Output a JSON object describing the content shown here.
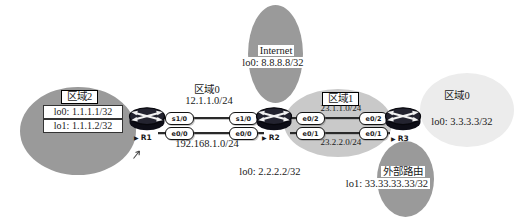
{
  "diagram_title": "OSPF multi-area network topology",
  "colors": {
    "cloud_gray": "#9a9a9a",
    "cloud_light_gray": "#c9c9c9",
    "cloud_pale_gray": "#ececec",
    "link_line": "#2a2a2a",
    "text": "#1a1a1a",
    "router_body": "#14141e",
    "box_bg": "#ffffff"
  },
  "icons": {
    "pointer": "▶",
    "router_icon": "cisco-router-cylinder-with-cross-arrows",
    "cursor_icon": "small-diagonal-arrow-mark"
  },
  "area2": {
    "title": "区域2",
    "lo0": "lo0: 1.1.1.1/32",
    "lo1": "lo1: 1.1.1.2/32"
  },
  "area0_mid": {
    "title": "区域0",
    "top_network": "12.1.1.0/24",
    "bottom_network": "192.168.1.0/24"
  },
  "internet": {
    "title": "Internet",
    "lo0": "lo0: 8.8.8.8/32"
  },
  "area1": {
    "title": "区域1",
    "top_network": "23.1.1.0/24",
    "bottom_network": "23.2.2.0/24"
  },
  "area0_right": {
    "title": "区域0",
    "lo0": "lo0: 3.3.3.3/32"
  },
  "external_route": {
    "title": "外部路由",
    "lo1": "lo1: 33.33.33.33/32"
  },
  "routers": {
    "r1": {
      "label": "R1",
      "if_top": "s1/0",
      "if_bottom": "e0/0"
    },
    "r2": {
      "label": "R2",
      "lo0": "lo0: 2.2.2.2/32",
      "if_left_top": "s1/0",
      "if_left_bottom": "e0/0",
      "if_right_top": "e0/2",
      "if_right_bottom": "e0/1"
    },
    "r3": {
      "label": "R3",
      "if_left_top": "e0/2",
      "if_left_bottom": "e0/1"
    }
  }
}
